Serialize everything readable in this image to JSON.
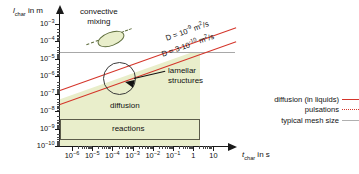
{
  "chart_data": {
    "type": "line",
    "title": "",
    "xlabel": "t_char in s",
    "ylabel": "l_char in m",
    "xlabel_symbol": "t",
    "xlabel_sub": "char",
    "xlabel_unit": "in s",
    "ylabel_symbol": "l",
    "ylabel_sub": "char",
    "ylabel_unit": "in m",
    "scale": "log-log",
    "grid": false,
    "xlim": [
      1e-06,
      30
    ],
    "ylim": [
      1e-10,
      0.003
    ],
    "x_ticks": [
      "10⁻⁶",
      "10⁻⁵",
      "10⁻⁴",
      "10⁻³",
      "10⁻²",
      "10⁻¹",
      "1",
      "10"
    ],
    "x_tick_exponents": [
      -6,
      -5,
      -4,
      -3,
      -2,
      -1,
      0,
      1
    ],
    "y_ticks": [
      "10⁻³",
      "10⁻⁴",
      "10⁻⁵",
      "10⁻⁶",
      "10⁻⁷",
      "10⁻⁸",
      "10⁻⁹",
      "10⁻¹⁰"
    ],
    "y_tick_exponents": [
      -3,
      -4,
      -5,
      -6,
      -7,
      -8,
      -9,
      -10
    ],
    "series": [
      {
        "name": "D = 10⁻⁹ m²/s",
        "type": "diffusion-line",
        "color": "#d4352a",
        "style": "solid",
        "relation": "l = sqrt(D t)",
        "D_value": "1e-9",
        "points": [
          [
            1e-06,
            3.2e-08
          ],
          [
            30,
            0.00017
          ]
        ]
      },
      {
        "name": "D = 3·10⁻¹⁰ m²/s",
        "type": "diffusion-line",
        "color": "#d4352a",
        "style": "solid",
        "relation": "l = sqrt(D t)",
        "D_value": "3e-10",
        "points": [
          [
            1e-06,
            1.7e-08
          ],
          [
            30,
            9.5e-05
          ]
        ]
      },
      {
        "name": "typical mesh size",
        "type": "horizontal-line",
        "color": "#a8a8a8",
        "style": "solid",
        "y_value": 1e-05
      }
    ],
    "regions": [
      {
        "name": "diffusion",
        "label": "diffusion",
        "fill": "#e9eecb",
        "x_range": [
          1e-06,
          1.0
        ],
        "y_range": [
          1e-10,
          1e-05
        ]
      },
      {
        "name": "reactions",
        "label": "reactions",
        "fill": "#e9eecb",
        "stroke": "#5c5c4a",
        "x_range": [
          1e-06,
          1.0
        ],
        "y_range": [
          5e-10,
          5e-09
        ]
      },
      {
        "name": "convective mixing",
        "label": "convective mixing",
        "fill": "#e9eecb",
        "stroke": "#5c6b3a",
        "shape": "ellipse"
      },
      {
        "name": "lamellar structures",
        "label": "lamellar structures",
        "shape": "circle",
        "stroke": "#3a3a3a"
      }
    ],
    "annotations": [
      {
        "text": "convective mixing",
        "x": 0.0003,
        "y": 0.0005
      },
      {
        "text": "lamellar structures",
        "x": 0.01,
        "y": 1.5e-06
      },
      {
        "text": "diffusion",
        "x": 0.001,
        "y": 2e-08
      },
      {
        "text": "reactions",
        "x": 0.001,
        "y": 1.5e-09
      },
      {
        "text": "D = 10⁻⁹ m²/s",
        "rotated": true
      },
      {
        "text": "D = 3·10⁻¹⁰ m²/s",
        "rotated": true
      }
    ],
    "legend": {
      "position": "right",
      "entries": [
        {
          "label": "diffusion (in liquids)",
          "color": "#d4352a",
          "style": "solid"
        },
        {
          "label": "pulsations",
          "color": "#d4352a",
          "style": "dotted"
        },
        {
          "label": "typical mesh size",
          "color": "#b0b0b0",
          "style": "solid"
        }
      ]
    }
  },
  "axes": {
    "y_title_symbol": "l",
    "y_title_sub": "char",
    "y_title_unit": "in m",
    "x_title_symbol": "t",
    "x_title_sub": "char",
    "x_title_unit": "in s",
    "y_tick_labels": [
      {
        "base": "10",
        "exp": "-3"
      },
      {
        "base": "10",
        "exp": "-4"
      },
      {
        "base": "10",
        "exp": "-5"
      },
      {
        "base": "10",
        "exp": "-6"
      },
      {
        "base": "10",
        "exp": "-7"
      },
      {
        "base": "10",
        "exp": "-8"
      },
      {
        "base": "10",
        "exp": "-9"
      },
      {
        "base": "10",
        "exp": "-10"
      }
    ],
    "x_tick_labels": [
      {
        "base": "10",
        "exp": "-6"
      },
      {
        "base": "10",
        "exp": "-5"
      },
      {
        "base": "10",
        "exp": "-4"
      },
      {
        "base": "10",
        "exp": "-3"
      },
      {
        "base": "10",
        "exp": "-2"
      },
      {
        "base": "10",
        "exp": "-1"
      },
      {
        "base": "1",
        "exp": ""
      },
      {
        "base": "10",
        "exp": ""
      }
    ]
  },
  "labels": {
    "convective_line1": "convective",
    "convective_line2": "mixing",
    "lamellar_line1": "lamellar",
    "lamellar_line2": "structures",
    "diffusion": "diffusion",
    "reactions": "reactions",
    "dline_upper_prefix": "D = 10",
    "dline_upper_exp": "-9",
    "dline_upper_unit_base": " m",
    "dline_upper_unit_exp": "2",
    "dline_upper_unit_tail": "/s",
    "dline_lower_prefix": "D = 3·10",
    "dline_lower_exp": "-10",
    "dline_lower_unit_base": " m",
    "dline_lower_unit_exp": "2",
    "dline_lower_unit_tail": "/s"
  },
  "legend": {
    "items": [
      {
        "label": "diffusion (in liquids)",
        "swatch": "solid-red"
      },
      {
        "label": "pulsations",
        "swatch": "dotted-red"
      },
      {
        "label": "typical mesh size",
        "swatch": "solid-gray"
      }
    ]
  },
  "colors": {
    "diffusion_line": "#d4352a",
    "mesh_line": "#a8a8a8",
    "region_fill": "#e9eecb",
    "region_stroke": "#5c5c4a",
    "axis": "#1a1a1a",
    "background": "#ffffff"
  }
}
